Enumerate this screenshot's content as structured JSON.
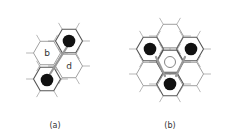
{
  "figure": {
    "panels": [
      {
        "id": "a",
        "caption": "(a)",
        "caption_pos": [
          55,
          121
        ],
        "hex_radius": 13.5,
        "hexes": [
          {
            "cx": 69,
            "cy": 41,
            "label": "",
            "bold": true
          },
          {
            "cx": 47,
            "cy": 53,
            "label": "b",
            "bold": false
          },
          {
            "cx": 69,
            "cy": 66,
            "label": "d",
            "bold": false
          },
          {
            "cx": 47,
            "cy": 79,
            "label": "",
            "bold": true
          }
        ],
        "black_dots": [
          [
            69,
            41
          ],
          [
            47,
            80
          ]
        ],
        "white_dots": [],
        "arrows": [
          [
            50,
            74,
            67,
            47
          ]
        ]
      },
      {
        "id": "b",
        "caption": "(b)",
        "caption_pos": [
          170,
          121
        ],
        "hex_radius": 13.5,
        "hexes": [
          {
            "cx": 150,
            "cy": 49,
            "label": "",
            "bold": true
          },
          {
            "cx": 190,
            "cy": 49,
            "label": "",
            "bold": true
          },
          {
            "cx": 170,
            "cy": 62,
            "label": "",
            "bold": true
          },
          {
            "cx": 170,
            "cy": 84,
            "label": "",
            "bold": true
          },
          {
            "cx": 170,
            "cy": 36,
            "label": "",
            "bold": false
          },
          {
            "cx": 150,
            "cy": 74,
            "label": "",
            "bold": false
          },
          {
            "cx": 190,
            "cy": 74,
            "label": "",
            "bold": false
          }
        ],
        "black_dots": [
          [
            150,
            49
          ],
          [
            191,
            49
          ],
          [
            170,
            84
          ]
        ],
        "white_dots": [
          [
            170,
            62
          ]
        ],
        "arrows": [
          [
            156,
            57,
            165,
            76
          ],
          [
            185,
            57,
            176,
            76
          ]
        ]
      }
    ]
  }
}
